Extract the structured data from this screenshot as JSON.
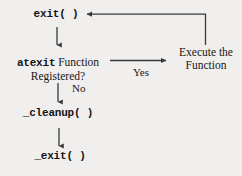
{
  "diagram": {
    "background_color": "#f1efed",
    "stroke_color": "#3a3a3a",
    "text_color": "#171717",
    "nodes": [
      {
        "id": "exit",
        "label": "exit( )",
        "style": "mono",
        "lines": [
          "exit( )"
        ]
      },
      {
        "id": "atexit",
        "label": "atexit Function Registered?",
        "style": "mixed",
        "lines": [
          "atexit Function",
          "Registered?"
        ],
        "mono_part": "atexit",
        "serif_part": " Function",
        "second_line": "Registered?"
      },
      {
        "id": "cleanup",
        "label": "_cleanup( )",
        "style": "mono",
        "lines": [
          "_cleanup( )"
        ]
      },
      {
        "id": "under_exit",
        "label": "_exit( )",
        "style": "mono",
        "lines": [
          "_exit( )"
        ]
      },
      {
        "id": "execute",
        "label": "Execute the Function",
        "style": "serif",
        "lines": [
          "Execute the",
          "Function"
        ]
      }
    ],
    "edges": [
      {
        "id": "exit-to-atexit",
        "from": "exit",
        "to": "atexit",
        "label": "",
        "direction": "down"
      },
      {
        "id": "atexit-to-execute",
        "from": "atexit",
        "to": "execute",
        "label": "Yes",
        "direction": "right"
      },
      {
        "id": "atexit-to-cleanup",
        "from": "atexit",
        "to": "cleanup",
        "label": "No",
        "direction": "down"
      },
      {
        "id": "cleanup-to-underexit",
        "from": "cleanup",
        "to": "under_exit",
        "label": "",
        "direction": "down"
      },
      {
        "id": "execute-to-exit",
        "from": "execute",
        "to": "exit",
        "label": "",
        "direction": "up-left"
      }
    ],
    "edge_labels": {
      "yes": "Yes",
      "no": "No"
    }
  }
}
